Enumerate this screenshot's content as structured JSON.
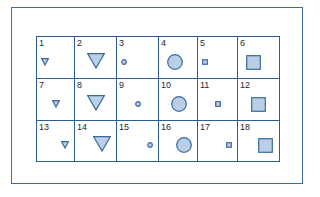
{
  "colors": {
    "line": "#2f5f92",
    "fill": "#b9cfe6",
    "stroke": "#3c6a9c",
    "text": "#1e2a38"
  },
  "cells": [
    {
      "n": "1",
      "shape": "triangle",
      "size": "small",
      "pos": "left"
    },
    {
      "n": "2",
      "shape": "triangle",
      "size": "large",
      "pos": "center"
    },
    {
      "n": "3",
      "shape": "circle",
      "size": "small",
      "pos": "left"
    },
    {
      "n": "4",
      "shape": "circle",
      "size": "large",
      "pos": "left"
    },
    {
      "n": "5",
      "shape": "square",
      "size": "small",
      "pos": "left"
    },
    {
      "n": "6",
      "shape": "square",
      "size": "large",
      "pos": "left"
    },
    {
      "n": "7",
      "shape": "triangle",
      "size": "small",
      "pos": "center"
    },
    {
      "n": "8",
      "shape": "triangle",
      "size": "large",
      "pos": "center"
    },
    {
      "n": "9",
      "shape": "circle",
      "size": "small",
      "pos": "center"
    },
    {
      "n": "10",
      "shape": "circle",
      "size": "large",
      "pos": "center"
    },
    {
      "n": "11",
      "shape": "square",
      "size": "small",
      "pos": "center"
    },
    {
      "n": "12",
      "shape": "square",
      "size": "large",
      "pos": "center"
    },
    {
      "n": "13",
      "shape": "triangle",
      "size": "small",
      "pos": "right"
    },
    {
      "n": "14",
      "shape": "triangle",
      "size": "large",
      "pos": "right"
    },
    {
      "n": "15",
      "shape": "circle",
      "size": "small",
      "pos": "right"
    },
    {
      "n": "16",
      "shape": "circle",
      "size": "large",
      "pos": "right"
    },
    {
      "n": "17",
      "shape": "square",
      "size": "small",
      "pos": "right"
    },
    {
      "n": "18",
      "shape": "square",
      "size": "large",
      "pos": "right"
    }
  ]
}
